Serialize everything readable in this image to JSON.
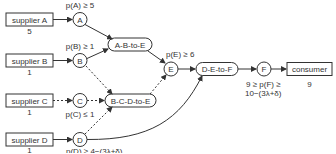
{
  "suppliers": [
    {
      "id": "A",
      "label": "supplier A",
      "value": "5"
    },
    {
      "id": "B",
      "label": "supplier B",
      "value": "1"
    },
    {
      "id": "C",
      "label": "supplier C",
      "value": "1"
    },
    {
      "id": "D",
      "label": "supplier D",
      "value": "1"
    }
  ],
  "nodes": {
    "A": {
      "label": "A",
      "constraint": "p(A) ≥ 5"
    },
    "B": {
      "label": "B",
      "constraint": "p(B) ≥ 1"
    },
    "C": {
      "label": "C",
      "constraint": "p(C) ≤ 1"
    },
    "D": {
      "label": "D",
      "constraint": "p(D) ≥ 4−(3λ+δ)"
    },
    "E": {
      "label": "E",
      "constraint": "p(E) ≥ 6"
    },
    "F": {
      "label": "F",
      "constraint_line1": "9 ≥ p(F) ≥",
      "constraint_line2": "10−(3λ+δ)"
    }
  },
  "processes": {
    "abe": "A-B-to-E",
    "bcde": "B-C-D-to-E",
    "def": "D-E-to-F"
  },
  "consumer": {
    "label": "consumer",
    "value": "9"
  },
  "colors": {
    "stroke": "#333333",
    "background": "#ffffff"
  }
}
